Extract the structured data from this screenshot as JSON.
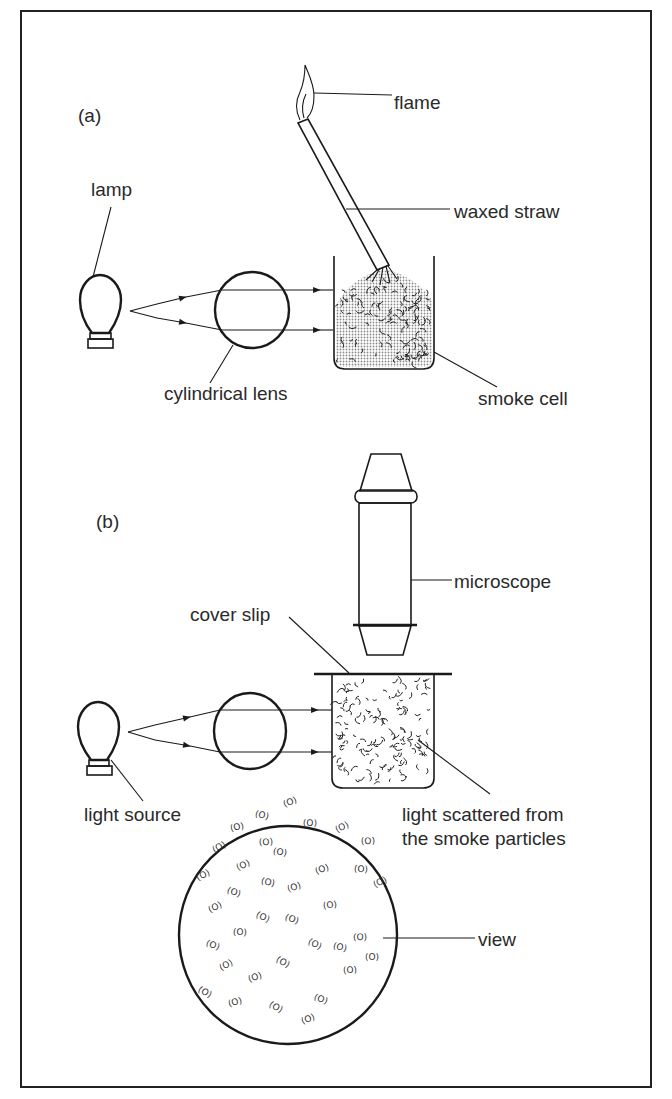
{
  "figure": {
    "part_a": {
      "label": "(a)",
      "labels": {
        "flame": "flame",
        "waxed_straw": "waxed straw",
        "lamp": "lamp",
        "cylindrical_lens": "cylindrical lens",
        "smoke_cell": "smoke cell"
      }
    },
    "part_b": {
      "label": "(b)",
      "labels": {
        "microscope": "microscope",
        "cover_slip": "cover slip",
        "light_source": "light source",
        "scattered_line1": "light scattered from",
        "scattered_line2": "the smoke particles",
        "view": "view"
      }
    },
    "particle_glyph": "(O)",
    "colors": {
      "ink": "#1a1a1a",
      "text": "#2a2a2a",
      "background": "#ffffff",
      "bulb_fill": "#b8b8b8"
    }
  }
}
